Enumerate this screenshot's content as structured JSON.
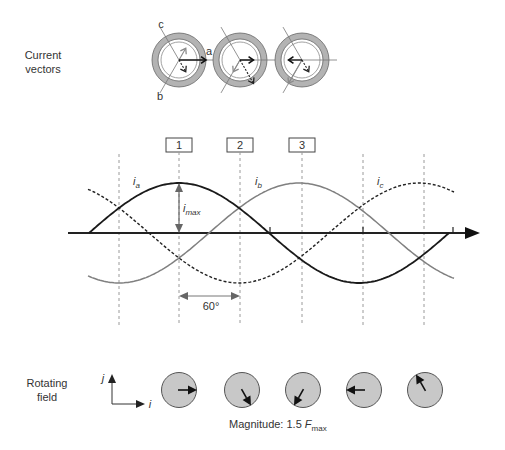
{
  "figure": {
    "current_vectors_label": {
      "line1": "Current",
      "line2": "vectors"
    },
    "rotating_field_label": {
      "line1": "Rotating",
      "line2": "field"
    },
    "phase_axis_labels": {
      "a": "a",
      "b": "b",
      "c": "c"
    },
    "instant_labels": [
      "1",
      "2",
      "3"
    ],
    "wave_labels": [
      {
        "var": "i",
        "sub": "a"
      },
      {
        "var": "i",
        "sub": "b"
      },
      {
        "var": "i",
        "sub": "c"
      }
    ],
    "imax_label": {
      "var": "i",
      "sub": "max"
    },
    "angle_label": "60°",
    "axes_labels": {
      "vertical": "j",
      "horizontal": "i"
    },
    "magnitude_label": {
      "prefix": "Magnitude: 1.5 ",
      "var": "F",
      "sub": "max"
    }
  },
  "waveforms": {
    "type": "three-phase sinusoid",
    "angle_spacing_deg": 60,
    "series": [
      {
        "name": "ia",
        "phase_deg": 0,
        "start_deg": 0,
        "end_deg": 360,
        "style": "solid",
        "color": "#1a1a1a",
        "width": 1.8
      },
      {
        "name": "ib",
        "phase_deg": -120,
        "start_deg": -1,
        "end_deg": 366,
        "style": "solid",
        "color": "#808080",
        "width": 1.5
      },
      {
        "name": "ic",
        "phase_deg": -240,
        "start_deg": -1,
        "end_deg": 366,
        "style": "dashed",
        "color": "#222222",
        "width": 1.4
      }
    ]
  },
  "current_vectors": [
    {
      "instant": "1",
      "ia": 1.0,
      "ib": -0.5,
      "ic": -0.5
    },
    {
      "instant": "2",
      "ia": 0.5,
      "ib": 0.5,
      "ic": -1.0
    },
    {
      "instant": "3",
      "ia": -0.5,
      "ib": 1.0,
      "ic": -0.5
    }
  ],
  "phase_axis_angles_deg": {
    "a": 0,
    "b": 240,
    "c": 120
  },
  "rotating_field": {
    "angles_deg": [
      0,
      -60,
      -120,
      -180,
      -240
    ],
    "magnitude_factor": 1.5
  },
  "colors": {
    "text": "#333333",
    "ring": "#b3b3b3",
    "field_disc": "#c8c8c8",
    "axis": "#222222",
    "guide": "#9a9a9a"
  }
}
